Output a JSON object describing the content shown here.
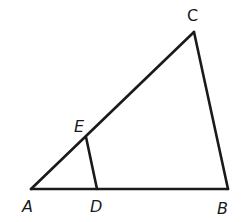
{
  "diagram": {
    "type": "geometry-triangle",
    "points": {
      "A": {
        "label": "A",
        "x": 31,
        "y": 189
      },
      "B": {
        "label": "B",
        "x": 228,
        "y": 189
      },
      "C": {
        "label": "C",
        "x": 194,
        "y": 32
      },
      "D": {
        "label": "D",
        "x": 97,
        "y": 189
      },
      "E": {
        "label": "E",
        "x": 86,
        "y": 137
      }
    },
    "segments": [
      "AB",
      "BC",
      "CA",
      "DE"
    ],
    "labels": {
      "A": "A",
      "B": "B",
      "C": "C",
      "D": "D",
      "E": "E"
    },
    "stroke_color": "#1a1a1a",
    "background": "#ffffff"
  }
}
